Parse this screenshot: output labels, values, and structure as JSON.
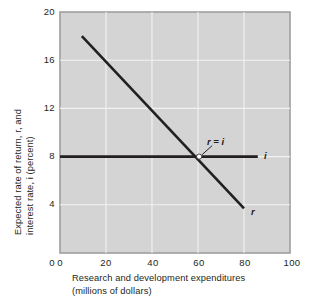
{
  "chart_data": {
    "type": "line",
    "title": "",
    "xlabel_line1": "Research and development expenditures",
    "xlabel_line2": "(millions of dollars)",
    "ylabel_line1": "Expected rate of return, r, and",
    "ylabel_line2": "interest rate, i (percent)",
    "xlim": [
      0,
      100
    ],
    "ylim": [
      0,
      20
    ],
    "xticks": [
      "0",
      "20",
      "40",
      "60",
      "80",
      "100"
    ],
    "xtick_values": [
      0,
      20,
      40,
      60,
      80,
      100
    ],
    "yticks": [
      "0",
      "4",
      "8",
      "12",
      "16",
      "20"
    ],
    "ytick_values": [
      0,
      4,
      8,
      12,
      16,
      20
    ],
    "grid": true,
    "grid_color": "#f2f2f2",
    "plot_background": "#d4d4d4",
    "line_color": "#231f20",
    "legend_position": "inline-curve-labels",
    "series": [
      {
        "name": "r",
        "label": "r",
        "description": "Expected rate of return curve, downward sloping",
        "points": [
          [
            9.5,
            18.0
          ],
          [
            80.0,
            3.7
          ]
        ]
      },
      {
        "name": "i",
        "label": "i",
        "description": "Interest rate, horizontal at 8 percent",
        "points": [
          [
            0.0,
            8.0
          ],
          [
            86.0,
            8.0
          ]
        ]
      }
    ],
    "annotations": [
      {
        "name": "equilibrium",
        "text": "r = i",
        "point": [
          60.5,
          8.0
        ],
        "marker": "open-circle"
      }
    ]
  }
}
